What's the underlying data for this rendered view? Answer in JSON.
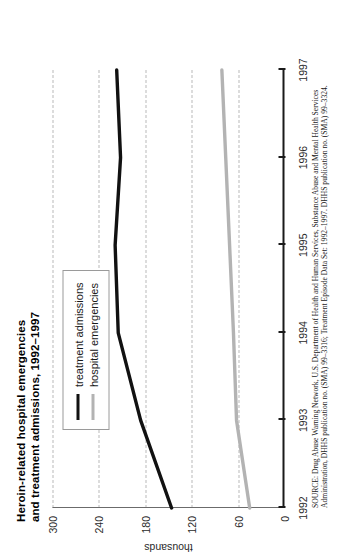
{
  "chart_data": {
    "type": "line",
    "title": "Heroin-related hospital emergencies and treatment admissions, 1992–1997",
    "title_line1": "Heroin-related hospital emergencies",
    "title_line2": "and treatment admissions, 1992–1997",
    "xlabel": "",
    "ylabel": "thousands",
    "categories": [
      "1992",
      "1993",
      "1994",
      "1995",
      "1996",
      "1997"
    ],
    "x": [
      1992,
      1993,
      1994,
      1995,
      1996,
      1997
    ],
    "series": [
      {
        "name": "treatment admissions",
        "color": "#111111",
        "values": [
          146,
          186,
          215,
          219,
          212,
          217
        ]
      },
      {
        "name": "hospital emergencies",
        "color": "#b3b3b3",
        "values": [
          45,
          62,
          66,
          71,
          76,
          81
        ]
      }
    ],
    "ylim": [
      0,
      300
    ],
    "yticks": [
      0,
      60,
      120,
      180,
      240,
      300
    ],
    "ytick_labels": [
      "0",
      "60",
      "120",
      "180",
      "240",
      "300"
    ],
    "xtick_labels": [
      "1992",
      "1993",
      "1994",
      "1995",
      "1996",
      "1997"
    ],
    "grid": true,
    "grid_axis": "y",
    "grid_style": "dashed",
    "legend_position": "upper-left-inside",
    "orientation": "page rotated 90 degrees counter-clockwise"
  },
  "legend": {
    "items": [
      {
        "label": "treatment admissions",
        "swatch": "black-line-swatch"
      },
      {
        "label": "hospital emergencies",
        "swatch": "gray-line-swatch"
      }
    ]
  },
  "source": {
    "line1": "SOURCE: Drug Abuse Warning Network, U.S. Department of Health and Human Services, Substance Abuse and Mental Health Services",
    "line2": "Administration, DHHS publication no. (SMA) 99–3316; Treatment Episode Data Set: 1992–1997. DHHS publication no. (SMA) 99–3324."
  },
  "axis": {
    "y_title": "thousands"
  }
}
